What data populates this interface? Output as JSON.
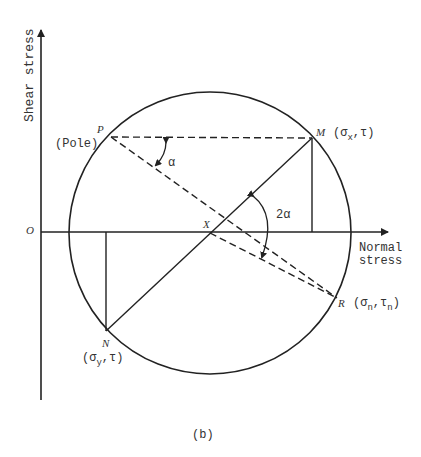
{
  "figure": {
    "caption": "(b)"
  },
  "axes": {
    "y_label": "Shear stress",
    "x_label_line1": "Normal",
    "x_label_line2": "stress",
    "origin_label": "O"
  },
  "points": {
    "pole": {
      "letter": "P",
      "note": "(Pole)"
    },
    "M": {
      "letter": "M",
      "coord": "(σ",
      "sub": "x",
      "tail": ",τ)"
    },
    "N": {
      "letter": "N",
      "coord": "(σ",
      "sub": "y",
      "tail": ",τ)"
    },
    "R": {
      "letter": "R",
      "coord": "(σ",
      "sub1": "n",
      "mid": ",τ",
      "sub2": "n",
      "tail": ")"
    },
    "center": {
      "letter": "X"
    }
  },
  "angles": {
    "small": "α",
    "large": "2α"
  },
  "colors": {
    "ink": "#222222",
    "background": "#ffffff"
  }
}
